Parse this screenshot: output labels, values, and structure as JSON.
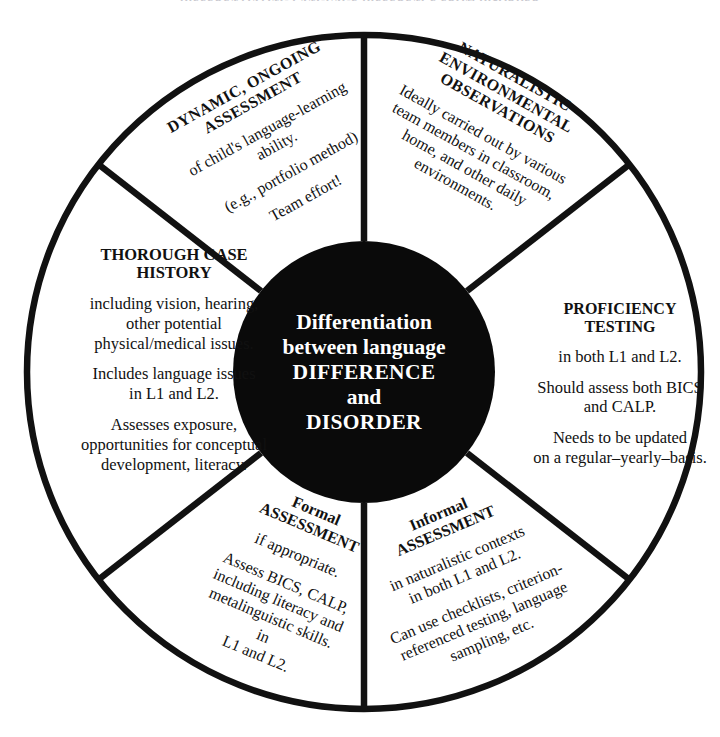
{
  "page": {
    "cut_off_title": "DIFFERENTIATING LANGUAGE DIFFERENCE FROM DISORDER",
    "background_color": "#ffffff",
    "ink_color": "#000000",
    "center_fill": "#000000",
    "center_text_color": "#ffffff"
  },
  "center": {
    "line1": "Differentiation",
    "line2": "between language",
    "line3": "DIFFERENCE",
    "line4": "and",
    "line5": "DISORDER"
  },
  "segments": [
    {
      "id": "dynamic-ongoing-assessment",
      "heading_line1": "DYNAMIC, ONGOING",
      "heading_line2": "ASSESSMENT",
      "body": [
        "of child's language-learning",
        "ability.",
        "",
        "(e.g., portfolio method)",
        "",
        "Team effort!"
      ]
    },
    {
      "id": "naturalistic-environmental-observations",
      "heading_line1": "NATURALISTIC",
      "heading_line2": "ENVIRONMENTAL",
      "heading_line3": "OBSERVATIONS",
      "body": [
        "Ideally carried out by various",
        "team members in classroom,",
        "home, and other daily",
        "environments."
      ]
    },
    {
      "id": "proficiency-testing",
      "heading_line1": "PROFICIENCY",
      "heading_line2": "TESTING",
      "body": [
        "in both L1 and L2.",
        "",
        "Should assess both BICS",
        "and CALP.",
        "",
        "Needs to be updated",
        "on a regular–yearly–basis."
      ]
    },
    {
      "id": "informal-assessment",
      "heading_line1": "Informal",
      "heading_line2": "ASSESSMENT",
      "body": [
        "in naturalistic contexts",
        "in both L1 and L2.",
        "",
        "Can use checklists, criterion-",
        "referenced testing, language",
        "sampling, etc."
      ]
    },
    {
      "id": "formal-assessment",
      "heading_line1": "Formal",
      "heading_line2": "ASSESSMENT",
      "body": [
        "if appropriate.",
        "",
        "Assess BICS, CALP,",
        "including literacy and",
        "metalinguistic skills.",
        "in",
        "L1 and L2."
      ]
    },
    {
      "id": "thorough-case-history",
      "heading_line1": "THOROUGH CASE",
      "heading_line2": "HISTORY",
      "body": [
        "including vision, hearing,",
        "other potential",
        "physical/medical issues.",
        "",
        "Includes language issues",
        "in L1 and L2.",
        "",
        "Assesses exposure,",
        "opportunities for conceptual",
        "development, literacy."
      ]
    }
  ],
  "geometry": {
    "center_x": 364,
    "center_y": 372,
    "outer_radius": 340,
    "inner_radius": 131,
    "stroke_width": 7,
    "spoke_angles_deg": [
      90,
      270,
      38,
      142,
      218,
      322
    ]
  }
}
